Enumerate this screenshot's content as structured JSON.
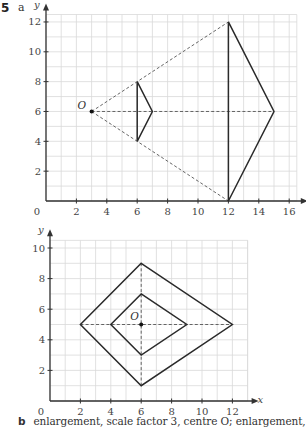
{
  "question": {
    "number": "5",
    "part_a_label": "a",
    "part_b_label": "b",
    "part_b_text": "enlargement, scale factor 3, centre O; enlargement, scale"
  },
  "colors": {
    "grid": "#d9d9d9",
    "axis": "#333333",
    "shape": "#2a2a2a",
    "dashed": "#555555"
  },
  "chart_data": [
    {
      "type": "diagram",
      "title": "Part a: enlargement of triangle from centre O",
      "xlabel": "x",
      "ylabel": "y",
      "xlim": [
        0,
        16.5
      ],
      "ylim": [
        0,
        12.5
      ],
      "grid": true,
      "x_ticks": [
        2,
        4,
        6,
        8,
        10,
        12,
        14,
        16
      ],
      "y_ticks": [
        2,
        4,
        6,
        8,
        10,
        12
      ],
      "origin_label": "0",
      "centre": {
        "label": "O",
        "x": 3,
        "y": 6
      },
      "shapes": [
        {
          "name": "object-triangle",
          "points": [
            [
              6,
              8
            ],
            [
              7,
              6
            ],
            [
              6,
              4
            ]
          ],
          "closed": true
        },
        {
          "name": "image-triangle",
          "points": [
            [
              12,
              12
            ],
            [
              15,
              6
            ],
            [
              12,
              0
            ]
          ],
          "closed": true
        }
      ],
      "construction_lines": [
        {
          "from": [
            3,
            6
          ],
          "to": [
            12,
            12
          ]
        },
        {
          "from": [
            3,
            6
          ],
          "to": [
            15,
            6
          ]
        },
        {
          "from": [
            3,
            6
          ],
          "to": [
            12,
            0
          ]
        }
      ]
    },
    {
      "type": "diagram",
      "title": "Part b: enlargement of rhombus from centre O",
      "xlabel": "x",
      "ylabel": "y",
      "xlim": [
        0,
        13
      ],
      "ylim": [
        0,
        10.5
      ],
      "grid": true,
      "x_ticks": [
        2,
        4,
        6,
        8,
        10,
        12
      ],
      "y_ticks": [
        2,
        4,
        6,
        8,
        10
      ],
      "origin_label": "0",
      "centre": {
        "label": "O",
        "x": 6,
        "y": 5
      },
      "shapes": [
        {
          "name": "inner-rhombus",
          "points": [
            [
              6,
              7
            ],
            [
              9,
              5
            ],
            [
              6,
              3
            ],
            [
              4,
              5
            ]
          ],
          "closed": true
        },
        {
          "name": "outer-rhombus",
          "points": [
            [
              6,
              9
            ],
            [
              12,
              5
            ],
            [
              6,
              1
            ],
            [
              2,
              5
            ]
          ],
          "closed": true
        }
      ],
      "construction_lines": [
        {
          "from": [
            2,
            5
          ],
          "to": [
            12,
            5
          ]
        },
        {
          "from": [
            6,
            1
          ],
          "to": [
            6,
            9
          ]
        }
      ]
    }
  ]
}
